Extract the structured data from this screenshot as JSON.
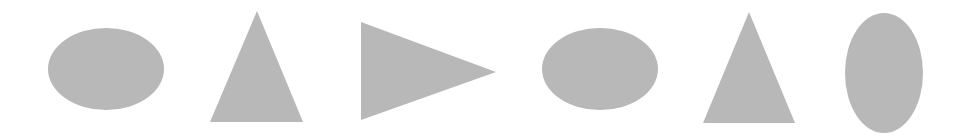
{
  "canvas": {
    "width": 958,
    "height": 139,
    "background": "#ffffff"
  },
  "fill_color": "#b8b8b8",
  "shapes": [
    {
      "type": "ellipse",
      "cx": 106,
      "cy": 69,
      "rx": 58,
      "ry": 41
    },
    {
      "type": "triangle-up",
      "points": "257,11 210,122 303,122"
    },
    {
      "type": "triangle-right",
      "points": "361,22 496,72 361,120"
    },
    {
      "type": "ellipse",
      "cx": 600,
      "cy": 69,
      "rx": 58,
      "ry": 41
    },
    {
      "type": "triangle-up",
      "points": "749,12 703,123 795,123"
    },
    {
      "type": "ellipse",
      "cx": 884,
      "cy": 73,
      "rx": 39,
      "ry": 60
    }
  ]
}
